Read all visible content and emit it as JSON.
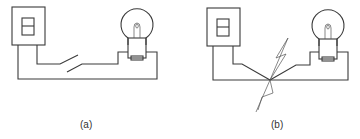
{
  "figure": {
    "panels": [
      {
        "label": "(a)",
        "description": "Wall switch box wired to light bulb with open switch in the circuit",
        "components": [
          "switch-box",
          "wall-switch",
          "open-knife-switch",
          "light-bulb",
          "wires"
        ]
      },
      {
        "label": "(b)",
        "description": "Wall switch box wired to light bulb with a short circuit (spark) where wires meet",
        "components": [
          "switch-box",
          "wall-switch",
          "short-circuit-spark",
          "light-bulb",
          "wires"
        ]
      }
    ],
    "colors": {
      "line": "#3a3a3a",
      "background": "#ffffff"
    }
  }
}
